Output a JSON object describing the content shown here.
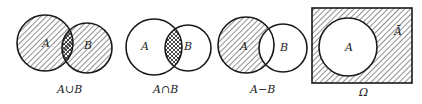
{
  "diagrams": [
    {
      "caption": "A∪B",
      "labels": {
        "a": "A",
        "b": "B"
      },
      "shaded": "union"
    },
    {
      "caption": "A∩B",
      "labels": {
        "a": "A",
        "b": "B"
      },
      "shaded": "intersection"
    },
    {
      "caption": "A−B",
      "labels": {
        "a": "A",
        "b": "B"
      },
      "shaded": "difference"
    },
    {
      "caption": "Ω",
      "labels": {
        "a": "A",
        "complement": "Ā"
      },
      "shaded": "complement"
    }
  ],
  "colors": {
    "stroke": "#1a1a1a",
    "hatch": "#333333",
    "background": "#ffffff"
  }
}
